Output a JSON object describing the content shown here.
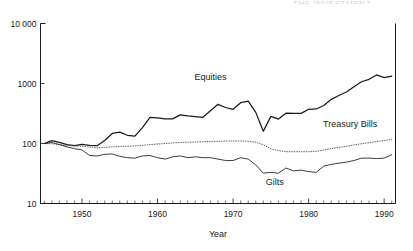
{
  "figure": {
    "header_fragment": "THE INVESTMENT",
    "xlabel": "Year",
    "ylabel": ""
  },
  "chart_data": {
    "type": "line",
    "title": "",
    "subtitle": "",
    "xlabel": "Year",
    "ylabel": "",
    "yscale": "log",
    "ylim": [
      10,
      10000
    ],
    "xlim": [
      1944.5,
      1991.5
    ],
    "grid": false,
    "legend_position": "inline-annotations",
    "ytick_labels": [
      "10",
      "100",
      "1000",
      "10 000"
    ],
    "ytick_values": [
      10,
      100,
      1000,
      10000
    ],
    "xtick_labels": [
      "1950",
      "1960",
      "1970",
      "1980",
      "1990"
    ],
    "xtick_values": [
      1950,
      1960,
      1970,
      1980,
      1990
    ],
    "x_minor_tick_interval": 1,
    "annotations": [
      {
        "text": "Equities",
        "x": 1967.0,
        "y": 1150
      },
      {
        "text": "Treasury Bills",
        "x": 1985.5,
        "y": 185
      },
      {
        "text": "Gilts",
        "x": 1975.5,
        "y": 20
      }
    ],
    "x": [
      1945,
      1946,
      1947,
      1948,
      1949,
      1950,
      1951,
      1952,
      1953,
      1954,
      1955,
      1956,
      1957,
      1958,
      1959,
      1960,
      1961,
      1962,
      1963,
      1964,
      1965,
      1966,
      1967,
      1968,
      1969,
      1970,
      1971,
      1972,
      1973,
      1974,
      1975,
      1976,
      1977,
      1978,
      1979,
      1980,
      1981,
      1982,
      1983,
      1984,
      1985,
      1986,
      1987,
      1988,
      1989,
      1990,
      1991
    ],
    "series": [
      {
        "name": "Equities",
        "style": "solid",
        "values": [
          100,
          112,
          104,
          96,
          92,
          97,
          93,
          92,
          112,
          147,
          155,
          137,
          133,
          184,
          272,
          267,
          258,
          257,
          300,
          288,
          281,
          273,
          352,
          450,
          398,
          371,
          478,
          510,
          330,
          160,
          283,
          255,
          320,
          318,
          318,
          372,
          376,
          430,
          545,
          632,
          722,
          884,
          1070,
          1175,
          1390,
          1250,
          1330
        ]
      },
      {
        "name": "Treasury Bills",
        "style": "dotted",
        "values": [
          100,
          99,
          96,
          93,
          91,
          90,
          87,
          85,
          86,
          88,
          89,
          90,
          91,
          93,
          96,
          98,
          100,
          102,
          104,
          105,
          106,
          107,
          108,
          109,
          110,
          110,
          110,
          109,
          105,
          95,
          82,
          76,
          73,
          73,
          73,
          73,
          74,
          78,
          82,
          86,
          90,
          95,
          99,
          103,
          108,
          112,
          118
        ]
      },
      {
        "name": "Gilts",
        "style": "solid",
        "values": [
          100,
          104,
          96,
          88,
          82,
          78,
          63,
          62,
          66,
          67,
          61,
          58,
          57,
          62,
          63,
          58,
          55,
          60,
          62,
          58,
          60,
          58,
          58,
          55,
          52,
          52,
          58,
          55,
          44,
          32,
          33,
          32,
          39,
          35,
          36,
          34,
          33,
          42,
          45,
          47,
          49,
          52,
          57,
          57,
          56,
          57,
          65
        ]
      }
    ]
  }
}
